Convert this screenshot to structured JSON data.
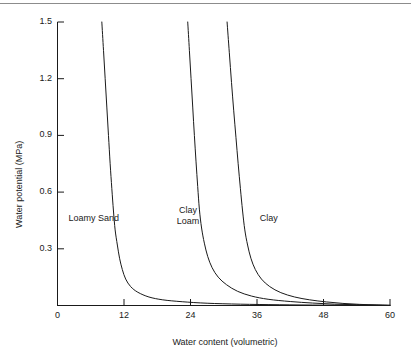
{
  "chart_data": {
    "type": "line",
    "title": "",
    "xlabel": "Water content (volumetric)",
    "ylabel": "Water potential (MPa)",
    "xlim": [
      0,
      60
    ],
    "ylim": [
      0,
      1.5
    ],
    "xticks": [
      "0",
      "12",
      "24",
      "36",
      "48",
      "60"
    ],
    "xtick_values": [
      0,
      12,
      24,
      36,
      48,
      60
    ],
    "yticks": [
      "0.3",
      "0.6",
      "0.9",
      "1.2",
      "1.5"
    ],
    "ytick_values": [
      0.3,
      0.6,
      0.9,
      1.2,
      1.5
    ],
    "grid": false,
    "legend": "inline-annotations",
    "line_color": "#1a1a1a",
    "series": [
      {
        "name": "Loamy Sand",
        "label_text": "Loamy Sand",
        "points": [
          [
            8.0,
            1.5
          ],
          [
            8.3,
            1.35
          ],
          [
            8.6,
            1.2
          ],
          [
            8.9,
            1.05
          ],
          [
            9.2,
            0.9
          ],
          [
            9.5,
            0.75
          ],
          [
            9.8,
            0.62
          ],
          [
            10.1,
            0.5
          ],
          [
            10.4,
            0.4
          ],
          [
            10.8,
            0.32
          ],
          [
            11.2,
            0.25
          ],
          [
            11.7,
            0.19
          ],
          [
            12.3,
            0.14
          ],
          [
            13.2,
            0.1
          ],
          [
            14.5,
            0.07
          ],
          [
            16.5,
            0.045
          ],
          [
            19.0,
            0.03
          ],
          [
            22.5,
            0.02
          ],
          [
            27.0,
            0.012
          ],
          [
            33.0,
            0.007
          ],
          [
            40.0,
            0.004
          ],
          [
            48.0,
            0.002
          ],
          [
            56.0,
            0.001
          ],
          [
            60.0,
            0.0
          ]
        ]
      },
      {
        "name": "Clay Loam",
        "label_text": "Clay\nLoam",
        "points": [
          [
            23.5,
            1.5
          ],
          [
            23.8,
            1.35
          ],
          [
            24.1,
            1.2
          ],
          [
            24.4,
            1.05
          ],
          [
            24.7,
            0.9
          ],
          [
            25.0,
            0.76
          ],
          [
            25.3,
            0.63
          ],
          [
            25.6,
            0.51
          ],
          [
            26.0,
            0.41
          ],
          [
            26.5,
            0.33
          ],
          [
            27.1,
            0.26
          ],
          [
            27.9,
            0.2
          ],
          [
            29.0,
            0.15
          ],
          [
            30.5,
            0.11
          ],
          [
            32.5,
            0.075
          ],
          [
            35.0,
            0.05
          ],
          [
            38.0,
            0.033
          ],
          [
            42.0,
            0.021
          ],
          [
            46.0,
            0.013
          ],
          [
            50.0,
            0.007
          ],
          [
            54.0,
            0.004
          ],
          [
            58.0,
            0.002
          ],
          [
            60.0,
            0.001
          ]
        ]
      },
      {
        "name": "Clay",
        "label_text": "Clay",
        "points": [
          [
            30.6,
            1.5
          ],
          [
            31.0,
            1.34
          ],
          [
            31.4,
            1.18
          ],
          [
            31.8,
            1.03
          ],
          [
            32.2,
            0.89
          ],
          [
            32.6,
            0.75
          ],
          [
            33.0,
            0.62
          ],
          [
            33.4,
            0.5
          ],
          [
            33.8,
            0.4
          ],
          [
            34.3,
            0.32
          ],
          [
            34.9,
            0.25
          ],
          [
            35.7,
            0.19
          ],
          [
            36.8,
            0.14
          ],
          [
            38.3,
            0.1
          ],
          [
            40.3,
            0.068
          ],
          [
            42.8,
            0.045
          ],
          [
            45.5,
            0.03
          ],
          [
            48.5,
            0.019
          ],
          [
            51.5,
            0.011
          ],
          [
            54.5,
            0.006
          ],
          [
            57.5,
            0.003
          ],
          [
            60.0,
            0.001
          ]
        ]
      }
    ],
    "annotations": [
      {
        "name": "loamy-sand-label",
        "text": "Loamy Sand",
        "x": 2.0,
        "y": 0.46
      },
      {
        "name": "clay-loam-label",
        "text": "Clay\nLoam",
        "x": 21.5,
        "y": 0.5
      },
      {
        "name": "clay-label",
        "text": "Clay",
        "x": 36.5,
        "y": 0.46
      }
    ]
  }
}
